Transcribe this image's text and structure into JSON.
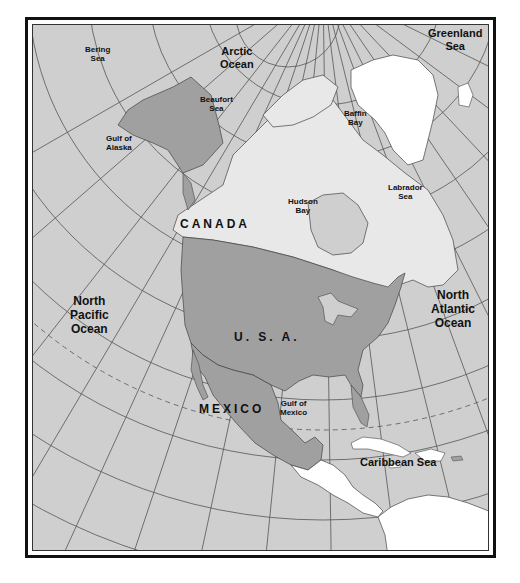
{
  "map": {
    "colors": {
      "ocean": "#cfcfcf",
      "usa_mexico_alaska": "#a0a0a0",
      "canada": "#e8e8e8",
      "other_land": "#ffffff",
      "grid": "#555555",
      "frame": "#111111"
    },
    "countries": {
      "canada": "CANADA",
      "usa": "U. S. A.",
      "mexico": "MEXICO"
    },
    "water_labels": {
      "bering_sea": [
        "Bering",
        "Sea"
      ],
      "arctic_ocean": [
        "Arctic",
        "Ocean"
      ],
      "greenland_sea": [
        "Greenland",
        "Sea"
      ],
      "beaufort_sea": [
        "Beaufort",
        "Sea"
      ],
      "baffin_bay": [
        "Baffin",
        "Bay"
      ],
      "gulf_of_alaska": [
        "Gulf of",
        "Alaska"
      ],
      "labrador_sea": [
        "Labrador",
        "Sea"
      ],
      "hudson_bay": [
        "Hudson",
        "Bay"
      ],
      "north_pacific_ocean": [
        "North",
        "Pacific",
        "Ocean"
      ],
      "north_atlantic_ocean": [
        "North",
        "Atlantic",
        "Ocean"
      ],
      "gulf_of_mexico": [
        "Gulf of",
        "Mexico"
      ],
      "caribbean_sea": "Caribbean Sea"
    }
  }
}
